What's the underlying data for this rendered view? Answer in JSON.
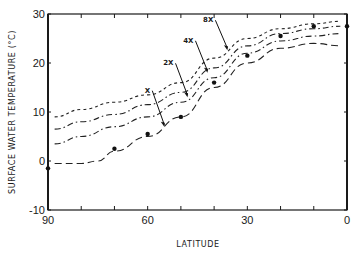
{
  "chart_data": {
    "type": "line",
    "title": "",
    "xlabel": "LATITUDE",
    "ylabel": "SURFACE WATER TEMPERATURE (°C)",
    "xlim": [
      90,
      0
    ],
    "ylim": [
      -10,
      30
    ],
    "x_ticks": [
      "90",
      "60",
      "30",
      "0"
    ],
    "y_ticks": [
      "30",
      "20",
      "10",
      "0",
      "-10"
    ],
    "grid": false,
    "legend": "none; curves labeled inline with arrows",
    "series": [
      {
        "name": "X",
        "style": "long-dash",
        "x": [
          88,
          80,
          75,
          70,
          60,
          50,
          40,
          30,
          20,
          10,
          2
        ],
        "values": [
          -0.5,
          -0.5,
          0,
          2,
          5,
          9,
          15,
          20,
          23,
          24,
          23.5
        ]
      },
      {
        "name": "2X",
        "style": "dash-dot",
        "x": [
          88,
          80,
          70,
          60,
          50,
          40,
          30,
          20,
          10,
          2
        ],
        "values": [
          3.5,
          5,
          7,
          9,
          12,
          17,
          22,
          24.5,
          25.5,
          26
        ]
      },
      {
        "name": "4X",
        "style": "dash-dot",
        "x": [
          88,
          80,
          70,
          60,
          50,
          40,
          30,
          20,
          10,
          2
        ],
        "values": [
          6.5,
          8,
          9.5,
          11.5,
          14,
          19,
          23.5,
          26,
          27,
          27.5
        ]
      },
      {
        "name": "8X",
        "style": "short-dash",
        "x": [
          88,
          80,
          70,
          60,
          50,
          40,
          30,
          20,
          10,
          2
        ],
        "values": [
          9,
          10.5,
          12,
          13.5,
          16,
          21,
          25,
          27,
          28,
          28.5
        ]
      }
    ],
    "observed_points": {
      "name": "observed",
      "x": [
        90,
        70,
        60,
        50,
        40,
        30,
        20,
        10,
        0
      ],
      "values": [
        -1.5,
        2.5,
        5.5,
        9,
        16,
        21.5,
        25.5,
        27.5,
        27.5
      ]
    },
    "annotations": [
      {
        "text": "X",
        "arrow_to_lat": 55
      },
      {
        "text": "2X",
        "arrow_to_lat": 48
      },
      {
        "text": "4X",
        "arrow_to_lat": 42
      },
      {
        "text": "8X",
        "arrow_to_lat": 36
      }
    ]
  }
}
